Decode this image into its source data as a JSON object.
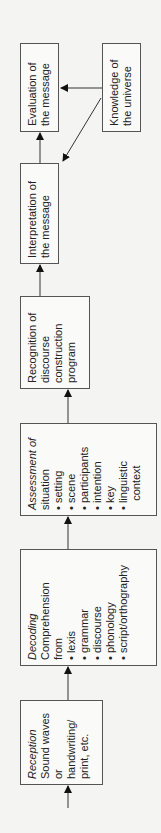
{
  "diagram": {
    "orientation": "rotated-90-ccw",
    "nodes": {
      "reception": {
        "title": "Reception",
        "lines": [
          "Sound waves",
          "or",
          "handwriting/",
          "print, etc."
        ]
      },
      "decoding": {
        "title": "Decoding",
        "lines": [
          "Comprehension",
          "from",
          "• lexis",
          "• grammar",
          "• discourse",
          "• phonology",
          "• script/orthography"
        ]
      },
      "assessment": {
        "title": "Assessment of",
        "title2": "situation",
        "lines": [
          "• setting",
          "• scene",
          "• participants",
          "• intention",
          "• key",
          "• linguistic",
          "   context"
        ]
      },
      "recognition": {
        "lines": [
          "Recognition of",
          "discourse",
          "construction",
          "program"
        ]
      },
      "interpretation": {
        "lines": [
          "Interpretation of",
          "the message"
        ]
      },
      "evaluation": {
        "lines": [
          "Evaluation of",
          "the message"
        ]
      },
      "knowledge": {
        "lines": [
          "Knowledge of",
          "the universe"
        ]
      }
    },
    "edges": [
      [
        "input",
        "reception"
      ],
      [
        "reception",
        "decoding"
      ],
      [
        "decoding",
        "assessment"
      ],
      [
        "assessment",
        "recognition"
      ],
      [
        "recognition",
        "interpretation"
      ],
      [
        "interpretation",
        "evaluation"
      ],
      [
        "knowledge",
        "evaluation"
      ],
      [
        "knowledge",
        "interpretation"
      ]
    ]
  }
}
